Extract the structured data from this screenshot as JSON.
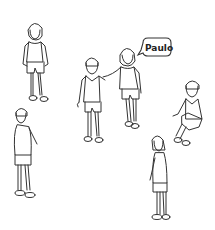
{
  "scene": {
    "description": "Line drawing of six children standing/sitting in a playground; one child introduces herself with a speech bubble",
    "background_color": "#ffffff",
    "ink_color": "#333333",
    "figures": [
      {
        "id": "girl-top-left",
        "pose": "standing"
      },
      {
        "id": "boy-center",
        "pose": "standing"
      },
      {
        "id": "girl-paulo-speaker",
        "pose": "standing, hand on boy's shoulder"
      },
      {
        "id": "child-right",
        "pose": "sitting"
      },
      {
        "id": "boy-bottom-left",
        "pose": "standing, side view"
      },
      {
        "id": "girl-bottom-right",
        "pose": "standing, side view"
      }
    ],
    "speech_bubble": {
      "text": "Paulo"
    }
  }
}
